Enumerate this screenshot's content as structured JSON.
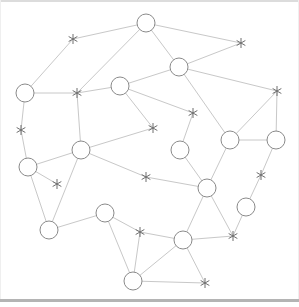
{
  "diagram": {
    "type": "network-graph",
    "style": {
      "edge_color": "#c8c8c8",
      "node_stroke": "#8a8a8a",
      "node_fill": "#ffffff",
      "star_color": "#6e6e6e",
      "node_radius": 9,
      "star_size": 5
    },
    "circle_nodes": [
      {
        "id": "A",
        "x": 146,
        "y": 23
      },
      {
        "id": "B",
        "x": 179,
        "y": 67
      },
      {
        "id": "C",
        "x": 25,
        "y": 93
      },
      {
        "id": "D",
        "x": 120,
        "y": 86
      },
      {
        "id": "E",
        "x": 81,
        "y": 150
      },
      {
        "id": "F",
        "x": 28,
        "y": 167
      },
      {
        "id": "G",
        "x": 180,
        "y": 150
      },
      {
        "id": "H",
        "x": 230,
        "y": 140
      },
      {
        "id": "I",
        "x": 276,
        "y": 140
      },
      {
        "id": "J",
        "x": 207,
        "y": 188
      },
      {
        "id": "K",
        "x": 246,
        "y": 207
      },
      {
        "id": "L",
        "x": 105,
        "y": 213
      },
      {
        "id": "M",
        "x": 49,
        "y": 230
      },
      {
        "id": "N",
        "x": 183,
        "y": 240
      },
      {
        "id": "O",
        "x": 133,
        "y": 281
      }
    ],
    "star_nodes": [
      {
        "id": "s1",
        "x": 73,
        "y": 39
      },
      {
        "id": "s2",
        "x": 241,
        "y": 43
      },
      {
        "id": "s3",
        "x": 77,
        "y": 93
      },
      {
        "id": "s4",
        "x": 21,
        "y": 130
      },
      {
        "id": "s5",
        "x": 153,
        "y": 128
      },
      {
        "id": "s6",
        "x": 193,
        "y": 113
      },
      {
        "id": "s7",
        "x": 277,
        "y": 91
      },
      {
        "id": "s8",
        "x": 57,
        "y": 184
      },
      {
        "id": "s9",
        "x": 146,
        "y": 177
      },
      {
        "id": "s10",
        "x": 261,
        "y": 175
      },
      {
        "id": "s11",
        "x": 140,
        "y": 232
      },
      {
        "id": "s12",
        "x": 233,
        "y": 236
      },
      {
        "id": "s13",
        "x": 205,
        "y": 283
      }
    ],
    "edges": [
      [
        "A",
        "s2"
      ],
      [
        "A",
        "B"
      ],
      [
        "A",
        "s3"
      ],
      [
        "s1",
        "A"
      ],
      [
        "s1",
        "C"
      ],
      [
        "C",
        "s3"
      ],
      [
        "s3",
        "D"
      ],
      [
        "s3",
        "E"
      ],
      [
        "C",
        "s4"
      ],
      [
        "s4",
        "F"
      ],
      [
        "D",
        "B"
      ],
      [
        "D",
        "s6"
      ],
      [
        "D",
        "s5"
      ],
      [
        "B",
        "s2"
      ],
      [
        "B",
        "s7"
      ],
      [
        "B",
        "H"
      ],
      [
        "s7",
        "H"
      ],
      [
        "s7",
        "I"
      ],
      [
        "H",
        "I"
      ],
      [
        "H",
        "J"
      ],
      [
        "s6",
        "G"
      ],
      [
        "G",
        "J"
      ],
      [
        "E",
        "s5"
      ],
      [
        "E",
        "s9"
      ],
      [
        "E",
        "F"
      ],
      [
        "F",
        "s8"
      ],
      [
        "F",
        "M"
      ],
      [
        "E",
        "M"
      ],
      [
        "s9",
        "J"
      ],
      [
        "J",
        "s12"
      ],
      [
        "J",
        "N"
      ],
      [
        "I",
        "s10"
      ],
      [
        "s10",
        "K"
      ],
      [
        "K",
        "s12"
      ],
      [
        "s12",
        "N"
      ],
      [
        "L",
        "M"
      ],
      [
        "L",
        "s11"
      ],
      [
        "L",
        "O"
      ],
      [
        "s11",
        "N"
      ],
      [
        "s11",
        "O"
      ],
      [
        "N",
        "O"
      ],
      [
        "N",
        "s13"
      ],
      [
        "O",
        "s13"
      ]
    ]
  }
}
